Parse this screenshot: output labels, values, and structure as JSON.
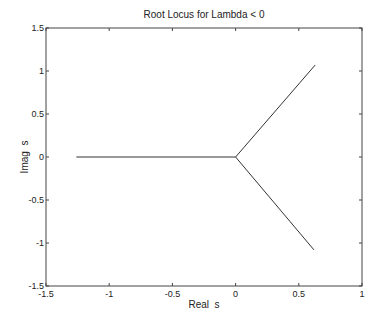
{
  "chart_data": {
    "type": "line",
    "title": "Root Locus for Lambda < 0",
    "xlabel": "Real  s",
    "ylabel": "Imag  s",
    "xlim": [
      -1.5,
      1
    ],
    "ylim": [
      -1.5,
      1.5
    ],
    "xticks": [
      -1.5,
      -1,
      -0.5,
      0,
      0.5,
      1
    ],
    "xtick_labels": [
      "-1.5",
      "-1",
      "-0.5",
      "0",
      "0.5",
      "1"
    ],
    "yticks": [
      -1.5,
      -1,
      -0.5,
      0,
      0.5,
      1,
      1.5
    ],
    "ytick_labels": [
      "-1.5",
      "-1",
      "-0.5",
      "0",
      "0.5",
      "1",
      "1.5"
    ],
    "grid": false,
    "legend": null,
    "series": [
      {
        "name": "real-axis branch",
        "x": [
          -1.26,
          0
        ],
        "y": [
          0,
          0
        ]
      },
      {
        "name": "upper branch",
        "x": [
          0,
          0.63
        ],
        "y": [
          0,
          1.07
        ]
      },
      {
        "name": "lower branch",
        "x": [
          0,
          0.62
        ],
        "y": [
          0,
          -1.08
        ]
      }
    ]
  },
  "colors": {
    "line": "#333333",
    "axis": "#444444",
    "background": "#ffffff"
  }
}
